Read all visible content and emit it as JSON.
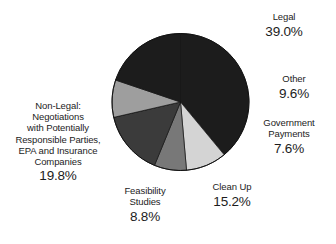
{
  "chart_data": {
    "type": "pie",
    "title": "",
    "subtitle": "",
    "xlabel": "",
    "ylabel": "",
    "legend_position": "none",
    "grid": false,
    "start_angle_deg": 0,
    "direction": "clockwise",
    "categories": [
      "Legal",
      "Other",
      "Government Payments",
      "Clean Up",
      "Feasibility Studies",
      "Non-Legal: Negotiations with Potentially Responsible Parties, EPA and Insurance Companies"
    ],
    "values": [
      39.0,
      9.6,
      7.6,
      15.2,
      8.8,
      19.8
    ],
    "value_unit": "%",
    "slices": [
      {
        "label": "Legal",
        "label_lines": "Legal",
        "value": 39.0,
        "value_text": "39.0%",
        "color": "#1c1c1c"
      },
      {
        "label": "Other",
        "label_lines": "Other",
        "value": 9.6,
        "value_text": "9.6%",
        "color": "#d4d4d4"
      },
      {
        "label": "Government Payments",
        "label_lines": "Government\nPayments",
        "value": 7.6,
        "value_text": "7.6%",
        "color": "#787878"
      },
      {
        "label": "Clean Up",
        "label_lines": "Clean Up",
        "value": 15.2,
        "value_text": "15.2%",
        "color": "#3b3b3b"
      },
      {
        "label": "Feasibility Studies",
        "label_lines": "Feasibility\nStudies",
        "value": 8.8,
        "value_text": "8.8%",
        "color": "#9e9e9e"
      },
      {
        "label": "Non-Legal: Negotiations with Potentially Responsible Parties, EPA and Insurance Companies",
        "label_lines": "Non-Legal:\nNegotiations\nwith Potentially\nResponsible Parties,\nEPA and Insurance\nCompanies",
        "value": 19.8,
        "value_text": "19.8%",
        "color": "#1c1c1c"
      }
    ],
    "geometry": {
      "center_x": 180.5,
      "center_y": 102,
      "radius": 68.5
    },
    "colors": {
      "background": "#ffffff",
      "text": "#1c1c1c",
      "outline": "#111111"
    }
  }
}
